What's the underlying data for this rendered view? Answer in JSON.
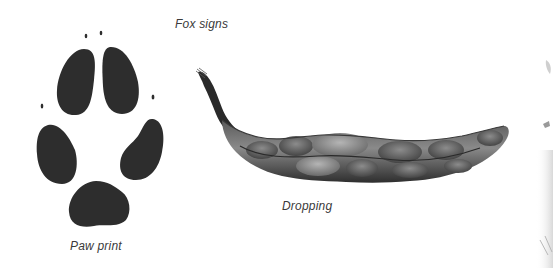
{
  "title": "Fox signs",
  "figures": [
    {
      "id": "paw-print",
      "caption": "Paw print",
      "icon": "paw-print-icon",
      "pads": [
        "toe-top-left",
        "toe-top-right",
        "toe-left",
        "toe-right",
        "heel"
      ],
      "claw_marks": 4,
      "color": "#2d2d2d"
    },
    {
      "id": "dropping",
      "caption": "Dropping",
      "icon": "dropping-icon",
      "color": "#4a4a4a"
    }
  ],
  "colors": {
    "background": "#ffffff",
    "text": "#3a3a3a",
    "pad_fill": "#2d2d2d"
  }
}
